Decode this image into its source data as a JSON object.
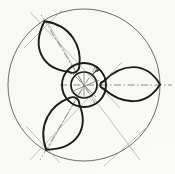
{
  "figure": {
    "background_color": "#fbfbf9",
    "line_color": "#1b1b1b",
    "construction_line_color": "#8c8c8c",
    "centerline_color": "#7a7a7a",
    "outline_color": "#3a3a3a"
  },
  "canvas": {
    "width": 175,
    "height": 174
  },
  "geometry": {
    "center": {
      "x": 84,
      "y": 85
    },
    "outer_circle": {
      "label": "outer-reference-circle",
      "radius": 76,
      "stroke_width": 0.9
    },
    "hub_outer_circle": {
      "label": "hub-outer-circle",
      "radius": 22,
      "stroke_width": 1.9
    },
    "hub_inner_circle": {
      "label": "hub-inner-circle",
      "radius": 13,
      "stroke_width": 1.7
    },
    "blade_count": 3,
    "blade_angles_deg": [
      0,
      120,
      240
    ],
    "blade_tip_radius": 76,
    "blade_root_radius": 20,
    "blade_half_width_deg": 26
  },
  "annotations": {
    "angle_marker": {
      "label": "b",
      "x": 96,
      "y": 72
    }
  },
  "elements": {
    "outer_circle_name": "outer-reference-circle",
    "hub_outer_name": "hub-outer-circle",
    "hub_inner_name": "hub-inner-circle",
    "blade_right_name": "blade-right",
    "blade_upper_left_name": "blade-upper-left",
    "blade_lower_left_name": "blade-lower-left",
    "centerline_right_name": "centerline-blade-right",
    "centerline_upper_left_name": "centerline-blade-upper-left",
    "centerline_lower_left_name": "centerline-blade-lower-left",
    "construction_group_name": "construction-lines",
    "hub_cross_name": "hub-cross-lines"
  }
}
